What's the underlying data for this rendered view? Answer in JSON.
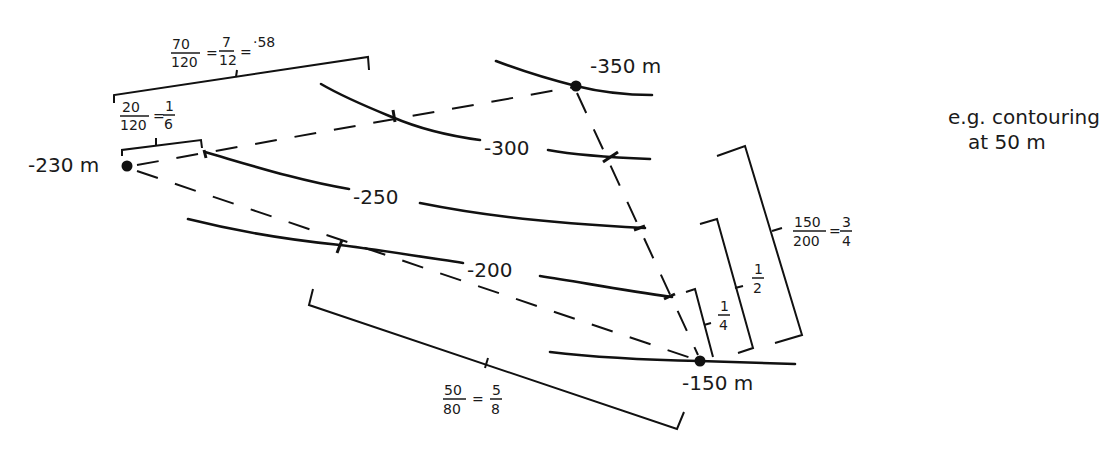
{
  "diagram": {
    "note": {
      "line1": "e.g.  contouring",
      "line2": "at 50 m"
    },
    "spot_heights": [
      {
        "label": "-230 m",
        "value": -230
      },
      {
        "label": "-350 m",
        "value": -350
      },
      {
        "label": "-150 m",
        "value": -150
      }
    ],
    "contours": [
      {
        "label": "-300",
        "value": -300
      },
      {
        "label": "-250",
        "value": -250
      },
      {
        "label": "-200",
        "value": -200
      }
    ],
    "fractions": {
      "f1": {
        "num": "70",
        "den": "120",
        "eq1_num": "7",
        "eq1_den": "12",
        "eq2": "·58"
      },
      "f2": {
        "num": "20",
        "den": "120",
        "eq1_num": "1",
        "eq1_den": "6"
      },
      "f3": {
        "num": "150",
        "den": "200",
        "eq1_num": "3",
        "eq1_den": "4"
      },
      "f4": {
        "num": "1",
        "den": "2"
      },
      "f5": {
        "num": "1",
        "den": "4"
      },
      "f6": {
        "num": "50",
        "den": "80",
        "eq1_num": "5",
        "eq1_den": "8"
      }
    },
    "symbols": {
      "equals": "="
    }
  }
}
